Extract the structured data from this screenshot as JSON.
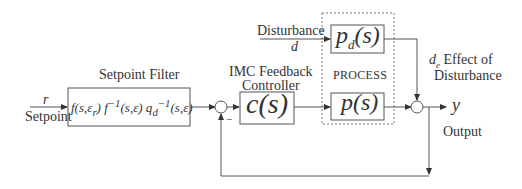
{
  "diagram": {
    "blocks": {
      "setpoint_filter": {
        "title": "Setpoint Filter",
        "expr_html": "f(s,ε<sub>r</sub>) f<sup>−1</sup>(s,ε) q<sub>d</sub><sup>−1</sup>(s,ε)"
      },
      "controller": {
        "title_line1": "IMC Feedback",
        "title_line2": "Controller",
        "expr": "c(s)"
      },
      "process": {
        "title": "PROCESS"
      },
      "disturbance_model": {
        "expr_base": "p",
        "expr_sub": "d",
        "expr_arg": "(s)"
      },
      "plant": {
        "expr": "p(s)"
      }
    },
    "signals": {
      "reference_symbol": "r",
      "reference_label": "Setpoint",
      "disturbance_label": "Disturbance",
      "disturbance_symbol": "d",
      "effect_symbol": "d",
      "effect_sub": "e",
      "effect_label_line1": "Effect of",
      "effect_label_line2": "Disturbance",
      "output_symbol": "y",
      "output_label": "Output",
      "feedback_sign": "−"
    },
    "colors": {
      "line": "#444444",
      "box": "#555555",
      "text": "#333333"
    }
  }
}
